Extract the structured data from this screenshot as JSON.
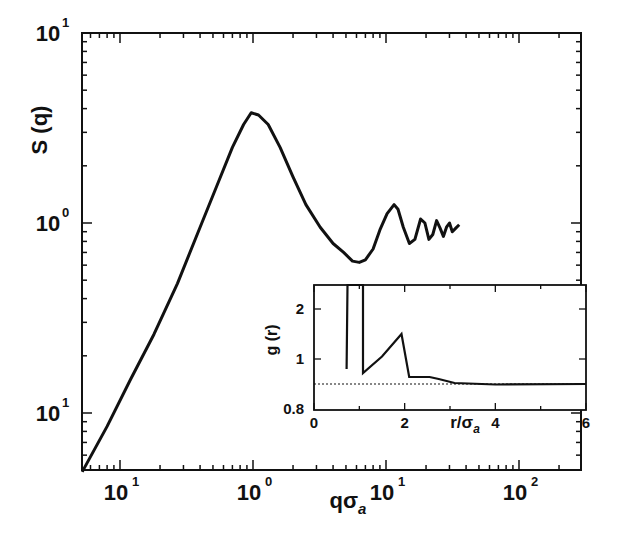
{
  "chart_data": [
    {
      "id": "main",
      "type": "line",
      "title": "",
      "xlabel": "qσ_a",
      "ylabel": "S (q)",
      "xscale": "log",
      "yscale": "log",
      "xlim": [
        0.052,
        295
      ],
      "ylim": [
        0.049,
        10
      ],
      "grid": false,
      "legend": null,
      "x_ticks": [
        {
          "value": 0.1,
          "label": "10",
          "sup": "1"
        },
        {
          "value": 1,
          "label": "10",
          "sup": "0"
        },
        {
          "value": 10,
          "label": "10",
          "sup": "1"
        },
        {
          "value": 100,
          "label": "10",
          "sup": "2"
        }
      ],
      "y_ticks": [
        {
          "value": 0.1,
          "label": "10",
          "sup": "1"
        },
        {
          "value": 1,
          "label": "10",
          "sup": "0"
        },
        {
          "value": 10,
          "label": "10",
          "sup": "1"
        }
      ],
      "series": [
        {
          "name": "S(q)",
          "x": [
            0.052,
            0.08,
            0.12,
            0.18,
            0.27,
            0.4,
            0.55,
            0.7,
            0.85,
            0.97,
            1.1,
            1.3,
            1.6,
            2.0,
            2.5,
            3.2,
            4.0,
            4.8,
            5.6,
            6.3,
            7.0,
            8.0,
            9.0,
            10.2,
            11.5,
            12.3,
            13.5,
            15.0,
            16.5,
            18.2,
            19.6,
            21.0,
            22.5,
            24.0,
            25.5,
            27.0,
            28.5,
            30.0,
            31.5,
            33.5,
            35.5
          ],
          "y": [
            0.049,
            0.085,
            0.15,
            0.26,
            0.48,
            0.95,
            1.65,
            2.5,
            3.3,
            3.8,
            3.7,
            3.3,
            2.5,
            1.75,
            1.25,
            0.95,
            0.78,
            0.7,
            0.63,
            0.62,
            0.64,
            0.73,
            0.92,
            1.12,
            1.25,
            1.18,
            0.95,
            0.78,
            0.82,
            1.05,
            1.0,
            0.82,
            0.87,
            1.03,
            0.94,
            0.85,
            0.95,
            1.0,
            0.9,
            0.94,
            0.98
          ],
          "color": "#111111"
        }
      ]
    },
    {
      "id": "inset",
      "type": "line",
      "title": "",
      "xlabel": "r/σ_a",
      "ylabel": "g (r)",
      "xscale": "linear",
      "yscale": "linear",
      "xlim": [
        0,
        6
      ],
      "ylim_pixel_ticks": [
        0.8,
        1,
        2
      ],
      "grid": false,
      "legend": null,
      "x_ticks": [
        {
          "value": 0,
          "label": "0"
        },
        {
          "value": 2,
          "label": "2"
        },
        {
          "value": 4,
          "label": "4"
        },
        {
          "value": 6,
          "label": "6"
        }
      ],
      "y_ticks": [
        {
          "value": 0.8,
          "label": "0.8"
        },
        {
          "value": 1,
          "label": "1"
        },
        {
          "value": 2,
          "label": "2"
        }
      ],
      "reference_line": {
        "value": 1,
        "style": "dotted",
        "label": ""
      },
      "series": [
        {
          "name": "g(r)",
          "x": [
            0.72,
            0.74,
            1.08,
            1.08,
            1.5,
            1.93,
            2.1,
            2.55,
            2.75,
            3.1,
            4.0,
            6.0
          ],
          "y": [
            0.8,
            2.5,
            2.5,
            0.72,
            1.05,
            1.5,
            0.64,
            0.64,
            0.6,
            0.52,
            0.49,
            0.5
          ],
          "color": "#111111"
        }
      ]
    }
  ],
  "layout": {
    "main_frame": {
      "left": 82,
      "top": 33,
      "right": 581,
      "bottom": 470
    },
    "inset_frame": {
      "left": 314,
      "top": 285,
      "right": 586,
      "bottom": 410
    }
  }
}
